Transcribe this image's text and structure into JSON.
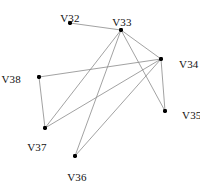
{
  "figure": {
    "type": "node-link-graph",
    "width": 200,
    "height": 185,
    "background_color": "#ffffff",
    "edge_color": "#8a8a8a",
    "node_color": "#000000",
    "label_color": "#111111"
  },
  "chart_data": {
    "type": "scatter",
    "title": "",
    "xlabel": "",
    "ylabel": "",
    "grid": false,
    "legend": "none",
    "xlim": [
      0,
      200
    ],
    "ylim": [
      0,
      185
    ],
    "nodes": [
      {
        "id": "V32",
        "label": "V32",
        "x": 70,
        "y": 23,
        "label_x": 70,
        "label_y": 13,
        "label_anchor": "center"
      },
      {
        "id": "V33",
        "label": "V33",
        "x": 121,
        "y": 30,
        "label_x": 122,
        "label_y": 17,
        "label_anchor": "center"
      },
      {
        "id": "V34",
        "label": "V34",
        "x": 161,
        "y": 59,
        "label_x": 179,
        "label_y": 59,
        "label_anchor": "left"
      },
      {
        "id": "V35",
        "label": "V35",
        "x": 165,
        "y": 111,
        "label_x": 182,
        "label_y": 110,
        "label_anchor": "left"
      },
      {
        "id": "V36",
        "label": "V36",
        "x": 75,
        "y": 156,
        "label_x": 77,
        "label_y": 172,
        "label_anchor": "center"
      },
      {
        "id": "V37",
        "label": "V37",
        "x": 45,
        "y": 128,
        "label_x": 37,
        "label_y": 142,
        "label_anchor": "center"
      },
      {
        "id": "V38",
        "label": "V38",
        "x": 39,
        "y": 77,
        "label_x": 21,
        "label_y": 74,
        "label_anchor": "right"
      }
    ],
    "edges": [
      {
        "source": "V32",
        "target": "V33"
      },
      {
        "source": "V33",
        "target": "V34"
      },
      {
        "source": "V33",
        "target": "V35"
      },
      {
        "source": "V33",
        "target": "V36"
      },
      {
        "source": "V33",
        "target": "V37"
      },
      {
        "source": "V34",
        "target": "V35"
      },
      {
        "source": "V34",
        "target": "V36"
      },
      {
        "source": "V34",
        "target": "V37"
      },
      {
        "source": "V34",
        "target": "V38"
      },
      {
        "source": "V37",
        "target": "V38"
      }
    ]
  }
}
